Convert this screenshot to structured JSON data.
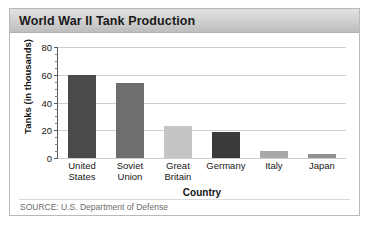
{
  "card": {
    "title": "World War II Tank Production",
    "source_prefix": "S",
    "source_smallcaps": "OURCE",
    "source_rest": ": U.S. Department of Defense",
    "source_full": "SOURCE: U.S. Department of Defense"
  },
  "chart_data": {
    "type": "bar",
    "title": "World War II Tank Production",
    "categories": [
      "United States",
      "Soviet Union",
      "Great Britain",
      "Germany",
      "Italy",
      "Japan"
    ],
    "category_lines": [
      [
        "United",
        "States"
      ],
      [
        "Soviet",
        "Union"
      ],
      [
        "Great",
        "Britain"
      ],
      [
        "Germany",
        ""
      ],
      [
        "Italy",
        ""
      ],
      [
        "Japan",
        ""
      ]
    ],
    "values": [
      60,
      54,
      23,
      19,
      5,
      3
    ],
    "bar_colors": [
      "#4a4a4a",
      "#6e6e6e",
      "#c5c5c5",
      "#3a3a3a",
      "#a8a8a8",
      "#8f8f8f"
    ],
    "xlabel": "Country",
    "ylabel": "Tanks (in thousands)",
    "ylim": [
      0,
      80
    ],
    "yticks": [
      0,
      20,
      40,
      60,
      80
    ],
    "ytick_labels": [
      "0",
      "20",
      "40",
      "60",
      "80"
    ],
    "minor_tick_step": 5,
    "grid": true,
    "legend": false
  },
  "colors": {
    "title_bar_top": "#e2e2e2",
    "title_bar_bottom": "#bdbdbd",
    "gridline": "#cfcfcf",
    "axis": "#5a5a5a",
    "border": "#b9b9b9"
  }
}
